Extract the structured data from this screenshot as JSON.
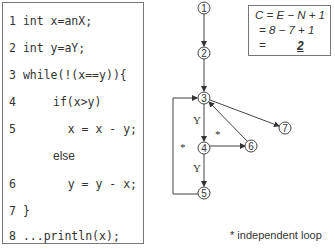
{
  "code": {
    "lines": [
      {
        "num": "1",
        "text": "int x=anX;"
      },
      {
        "num": "2",
        "text": "int y=aY;"
      },
      {
        "num": "3",
        "text": "while(!(x==y)){"
      },
      {
        "num": "4",
        "text": "if(x>y)"
      },
      {
        "num": "5",
        "text": "x = x - y;"
      },
      {
        "num": "",
        "text": "else"
      },
      {
        "num": "6",
        "text": "y = y - x;"
      },
      {
        "num": "7",
        "text": "}"
      },
      {
        "num": "8",
        "text": "...println(x);"
      }
    ]
  },
  "formula": {
    "line1": "C = E − N + 1",
    "line2": "= 8 − 7 + 1",
    "line3_eq": "=",
    "result": "2"
  },
  "graph": {
    "nodes": [
      {
        "id": "1",
        "x": 204,
        "y": 8
      },
      {
        "id": "2",
        "x": 204,
        "y": 53
      },
      {
        "id": "3",
        "x": 204,
        "y": 98
      },
      {
        "id": "4",
        "x": 204,
        "y": 148
      },
      {
        "id": "5",
        "x": 204,
        "y": 193
      },
      {
        "id": "6",
        "x": 251,
        "y": 146
      },
      {
        "id": "7",
        "x": 285,
        "y": 128
      }
    ],
    "edges": [
      {
        "from": "1",
        "to": "2",
        "label": ""
      },
      {
        "from": "2",
        "to": "3",
        "label": ""
      },
      {
        "from": "3",
        "to": "4",
        "label": "Y"
      },
      {
        "from": "3",
        "to": "7",
        "label": ""
      },
      {
        "from": "4",
        "to": "5",
        "label": "Y"
      },
      {
        "from": "4",
        "to": "6",
        "label": ""
      },
      {
        "from": "6",
        "to": "3",
        "label": ""
      },
      {
        "from": "5",
        "to": "3",
        "label": ""
      }
    ],
    "edge_labels": {
      "y1": "Y",
      "y2": "Y",
      "star1": "*",
      "star2": "*"
    }
  },
  "footnote": "* independent loop"
}
